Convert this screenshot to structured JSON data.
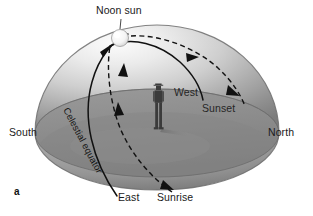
{
  "figure": {
    "panel_label": "a",
    "caption_labels": {
      "noon_sun": "Noon sun",
      "south": "South",
      "north": "North",
      "west": "West",
      "east": "East",
      "sunset": "Sunset",
      "sunrise": "Sunrise",
      "celestial_equator": "Celestial equator"
    },
    "colors": {
      "background": "#ffffff",
      "dome_highlight": "#f2f2f2",
      "dome_midtone": "#b4b4b4",
      "dome_shadow": "#7d7d7d",
      "ground_plane": "#8d8d8d",
      "ground_plane_dark": "#767676",
      "line": "#111111",
      "sun_fill": "#fbfbfb",
      "person": "#3c3c3c",
      "text": "#1a1a1a"
    },
    "elements": {
      "sun_label": "Noon sun",
      "observer": "person-silhouette",
      "solid_arc": "celestial-equator-arc",
      "dashed_arc": "sun-daily-path-arc"
    }
  }
}
